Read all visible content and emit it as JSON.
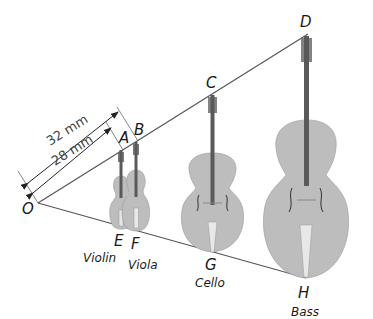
{
  "diagram": {
    "points": {
      "O": {
        "label": "O"
      },
      "A": {
        "label": "A"
      },
      "B": {
        "label": "B"
      },
      "C": {
        "label": "C"
      },
      "D": {
        "label": "D"
      },
      "E": {
        "label": "E"
      },
      "F": {
        "label": "F"
      },
      "G": {
        "label": "G"
      },
      "H": {
        "label": "H"
      }
    },
    "instruments": [
      {
        "name": "Violin",
        "top": "A",
        "bottom": "E"
      },
      {
        "name": "Viola",
        "top": "B",
        "bottom": "F"
      },
      {
        "name": "Cello",
        "top": "C",
        "bottom": "G"
      },
      {
        "name": "Bass",
        "top": "D",
        "bottom": "H"
      }
    ],
    "dimensions": {
      "outer": "32 mm",
      "inner": "28 mm"
    },
    "colors": {
      "instrument_body": "#bdbdbd",
      "neck": "#5a5a5a",
      "lines": "#555555"
    }
  }
}
